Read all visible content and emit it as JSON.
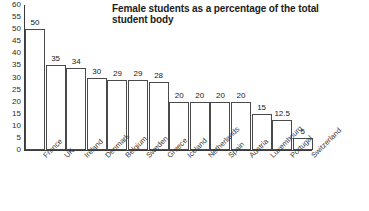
{
  "chart_data": {
    "type": "bar",
    "title": "Female students as a percentage of the total student body",
    "xlabel": "",
    "ylabel": "",
    "ylim": [
      0,
      60
    ],
    "ytick_step": 5,
    "yticks": [
      60,
      55,
      50,
      45,
      40,
      35,
      30,
      25,
      20,
      15,
      10,
      5,
      0
    ],
    "grid": false,
    "legend": false,
    "bar_style": {
      "fill": "#ffffff",
      "border": "#4a4a4a"
    },
    "value_labels_shown": true,
    "category_label_rotation": -45,
    "categories": [
      "France",
      "UK",
      "Ireland",
      "Denmark",
      "Belgium",
      "Sweden",
      "Greece",
      "Iceland",
      "Netherlands",
      "Spain",
      "Austria",
      "Luxembourg",
      "Portugal",
      "Switzerland"
    ],
    "values": [
      50,
      35,
      34,
      30,
      29,
      29,
      28,
      20,
      20,
      20,
      20,
      15,
      12.5,
      5
    ],
    "value_labels": [
      "50",
      "35",
      "34",
      "30",
      "29",
      "29",
      "28",
      "20",
      "20",
      "20",
      "20",
      "15",
      "12.5",
      "5"
    ]
  }
}
